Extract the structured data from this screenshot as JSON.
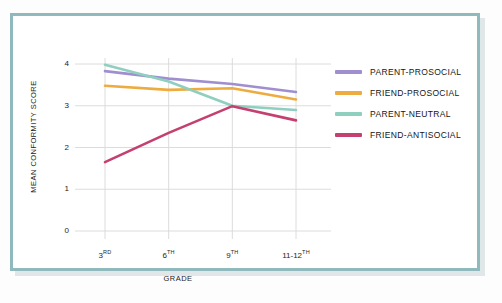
{
  "chart_data": {
    "type": "line",
    "title": "",
    "xlabel": "GRADE",
    "ylabel": "MEAN CONFORMITY SCORE",
    "categories": [
      "3RD",
      "6TH",
      "9TH",
      "11-12TH"
    ],
    "category_labels": [
      {
        "base": "3",
        "sup": "RD"
      },
      {
        "base": "6",
        "sup": "TH"
      },
      {
        "base": "9",
        "sup": "TH"
      },
      {
        "base": "11-12",
        "sup": "TH"
      }
    ],
    "ylim": [
      0,
      4
    ],
    "yticks": [
      "4",
      "3",
      "2",
      "1",
      "0"
    ],
    "ytick_values": [
      4,
      3,
      2,
      1,
      0
    ],
    "grid": true,
    "legend_position": "right",
    "series": [
      {
        "name": "PARENT-PROSOCIAL",
        "color": "#9f8fd0",
        "values": [
          3.83,
          3.65,
          3.52,
          3.33
        ]
      },
      {
        "name": "FRIEND-PROSOCIAL",
        "color": "#eeab3f",
        "values": [
          3.48,
          3.38,
          3.42,
          3.15
        ]
      },
      {
        "name": "PARENT-NEUTRAL",
        "color": "#8fcfc0",
        "values": [
          3.98,
          3.58,
          3.0,
          2.9
        ]
      },
      {
        "name": "FRIEND-ANTISOCIAL",
        "color": "#c44070",
        "values": [
          1.65,
          2.35,
          2.99,
          2.65
        ]
      }
    ]
  },
  "legend": {
    "items": [
      {
        "label": "PARENT-PROSOCIAL",
        "color": "#9f8fd0"
      },
      {
        "label": "FRIEND-PROSOCIAL",
        "color": "#eeab3f"
      },
      {
        "label": "PARENT-NEUTRAL",
        "color": "#8fcfc0"
      },
      {
        "label": "FRIEND-ANTISOCIAL",
        "color": "#c44070"
      }
    ]
  },
  "frame": {
    "border_color": "#8fb9bd",
    "background": "#ffffff",
    "grid_color": "#d8d8d8"
  },
  "caption": {
    "text": ""
  }
}
